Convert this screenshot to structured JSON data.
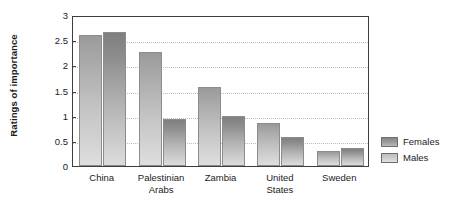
{
  "chart_data": {
    "type": "bar",
    "title": "",
    "xlabel": "",
    "ylabel": "Ratings of importance",
    "ylim": [
      0,
      3
    ],
    "yticks": [
      "0",
      "0.5",
      "1",
      "1.5",
      "2",
      "2.5",
      "3"
    ],
    "grid": true,
    "legend_position": "right",
    "categories": [
      "China",
      "Palestinian Arabs",
      "Zambia",
      "United States",
      "Sweden"
    ],
    "series": [
      {
        "name": "Females",
        "color": "#9a9a9a",
        "values": [
          2.6,
          2.27,
          1.57,
          0.85,
          0.3
        ]
      },
      {
        "name": "Males",
        "color": "#7f7f7f",
        "values": [
          2.67,
          0.93,
          0.99,
          0.58,
          0.36
        ]
      }
    ]
  },
  "legend": {
    "items": [
      {
        "label": "Females",
        "swatch": "female"
      },
      {
        "label": "Males",
        "swatch": "male"
      }
    ]
  }
}
